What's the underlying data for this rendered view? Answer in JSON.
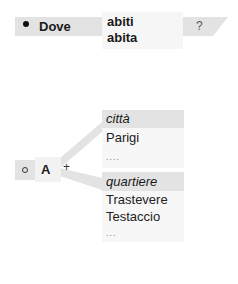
{
  "question_row": {
    "label": "Dove",
    "answers": [
      "abiti",
      "abita"
    ],
    "question_mark": "?"
  },
  "tree": {
    "root_label": "A",
    "plus": "+",
    "branches": [
      {
        "category": "città",
        "items": [
          "Parigi"
        ],
        "ellipsis": "...."
      },
      {
        "category": "quartiere",
        "items": [
          "Trastevere",
          "Testaccio"
        ],
        "ellipsis": "..."
      }
    ]
  },
  "colors": {
    "box_grey": "#e3e3e3",
    "box_light": "#f6f6f6",
    "connector": "#e0e0e0"
  }
}
